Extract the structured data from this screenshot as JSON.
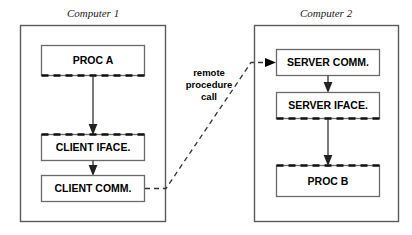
{
  "diagram": {
    "background_color": "#ffffff",
    "containers": [
      {
        "id": "computer-1",
        "title": "Computer 1",
        "border_color": "#5a5a5a",
        "nodes": [
          {
            "id": "proc-a",
            "label": "PROC A",
            "dashed_edge": "bottom"
          },
          {
            "id": "client-iface",
            "label": "CLIENT IFACE.",
            "dashed_edge": "top"
          },
          {
            "id": "client-comm",
            "label": "CLIENT COMM.",
            "dashed_edge": "none"
          }
        ],
        "flows": [
          {
            "from": "proc-a",
            "to": "client-iface"
          },
          {
            "from": "client-iface",
            "to": "client-comm"
          }
        ]
      },
      {
        "id": "computer-2",
        "title": "Computer 2",
        "border_color": "#5a5a5a",
        "nodes": [
          {
            "id": "server-comm",
            "label": "SERVER COMM.",
            "dashed_edge": "none"
          },
          {
            "id": "server-iface",
            "label": "SERVER IFACE.",
            "dashed_edge": "bottom"
          },
          {
            "id": "proc-b",
            "label": "PROC B",
            "dashed_edge": "top"
          }
        ],
        "flows": [
          {
            "from": "server-comm",
            "to": "server-iface"
          },
          {
            "from": "server-iface",
            "to": "proc-b"
          }
        ]
      }
    ],
    "rpc_connector": {
      "id": "remote-procedure-call",
      "label_lines": [
        "remote",
        "procedure",
        "call"
      ],
      "from": "client-comm",
      "to": "server-comm",
      "style": "dashed",
      "arrow_color": "#000000",
      "line_color": "#333333"
    }
  }
}
